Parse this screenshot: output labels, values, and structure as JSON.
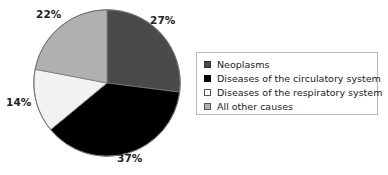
{
  "chart_data": {
    "type": "pie",
    "title": "",
    "subtitle": "",
    "xlabel": "",
    "ylabel": "",
    "grid": false,
    "legend_position": "right",
    "start_angle_deg": 0,
    "direction": "clockwise",
    "categories": [
      "Neoplasms",
      "Diseases of the circulatory system",
      "Diseases of the respiratory system",
      "All other causes"
    ],
    "values": [
      27,
      37,
      14,
      22
    ],
    "value_labels": [
      "27%",
      "37%",
      "14%",
      "22%"
    ],
    "units": "percent",
    "colors": [
      "#4a4a4a",
      "#000000",
      "#f2f2f2",
      "#b0b0b0"
    ],
    "slices": [
      {
        "label": "Neoplasms",
        "value": 27,
        "value_label": "27%",
        "color": "#4a4a4a"
      },
      {
        "label": "Diseases of the circulatory system",
        "value": 37,
        "value_label": "37%",
        "color": "#000000"
      },
      {
        "label": "Diseases of the respiratory system",
        "value": 14,
        "value_label": "14%",
        "color": "#f2f2f2"
      },
      {
        "label": "All other causes",
        "value": 22,
        "value_label": "22%",
        "color": "#b0b0b0"
      }
    ]
  },
  "legend": {
    "items": [
      {
        "label": "Neoplasms",
        "swatch": "dark-gray-swatch"
      },
      {
        "label": "Diseases of the circulatory system",
        "swatch": "black-swatch"
      },
      {
        "label": "Diseases of the respiratory system",
        "swatch": "white-swatch"
      },
      {
        "label": "All other causes",
        "swatch": "gray-swatch"
      }
    ]
  },
  "labels": {
    "neoplasms_pct": "27%",
    "circulatory_pct": "37%",
    "respiratory_pct": "14%",
    "other_pct": "22%"
  }
}
